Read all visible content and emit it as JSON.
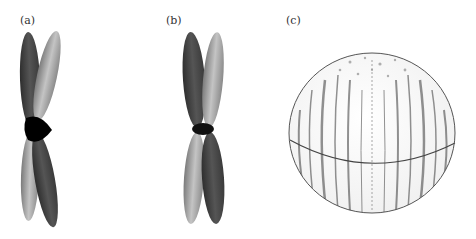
{
  "figure": {
    "panels": [
      {
        "label": "(a)",
        "description": "X-shaped chromosome, two sister chromatids, dark and light arms crossing at a black centromere",
        "colors": {
          "dark": "#4a4a4a",
          "light": "#9a9a9a",
          "centromere": "#000000"
        }
      },
      {
        "label": "(b)",
        "description": "Straight X-shaped chromosome, dark and light chromatids pinched at centromere",
        "colors": {
          "dark": "#454545",
          "light": "#a0a0a0",
          "centromere": "#111111"
        }
      },
      {
        "label": "(c)",
        "description": "Sphere with streaky vertical texture and an equator line",
        "colors": {
          "outline": "#555555",
          "streak": "#3a3a3a",
          "equator": "#444444"
        }
      }
    ]
  }
}
